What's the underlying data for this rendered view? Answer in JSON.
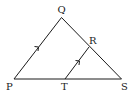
{
  "diagram": {
    "type": "geometry-triangle",
    "points": {
      "P": {
        "label": "P",
        "x": 14,
        "y": 79
      },
      "Q": {
        "label": "Q",
        "x": 61.5,
        "y": 17.5
      },
      "S": {
        "label": "S",
        "x": 121.5,
        "y": 79
      },
      "R": {
        "label": "R",
        "x": 89,
        "y": 47
      },
      "T": {
        "label": "T",
        "x": 65,
        "y": 79
      }
    },
    "segments": [
      "PQ",
      "QS",
      "PS",
      "TR"
    ],
    "parallel_marks": [
      "PQ",
      "TR"
    ],
    "colors": {
      "line": "#1a1a1a",
      "label": "#222222",
      "background": "#ffffff"
    }
  }
}
